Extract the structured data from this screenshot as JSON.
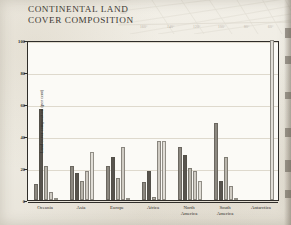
{
  "title": {
    "line1": "CONTINENTAL LAND",
    "line2": "COVER COMPOSITION"
  },
  "map": {
    "graticule_labels": [
      "180°",
      "160°",
      "140°",
      "120°",
      "100°",
      "80°",
      "60°"
    ],
    "line_color": "#d9d4c8"
  },
  "colors": {
    "paper": "#f0ede5",
    "plot_bg": "#fbfaf6",
    "axis": "#2f2d29",
    "grid": "#ded9cd",
    "series": [
      "#8c8880",
      "#58544e",
      "#b9b5ac",
      "#cfcbc3",
      "#e0ddd6"
    ]
  },
  "chart_data": {
    "type": "bar",
    "title": "CONTINENTAL LAND COVER COMPOSITION",
    "xlabel": "",
    "ylabel": "Land cover composition (per cent)",
    "ylim": [
      0,
      100
    ],
    "yticks": [
      0,
      20,
      40,
      60,
      80,
      100
    ],
    "ytick_labels": [
      "0",
      "20",
      "40",
      "60",
      "80",
      "100"
    ],
    "grid": true,
    "legend": "none",
    "categories": [
      "Oceania",
      "Asia",
      "Europe",
      "Africa",
      "North\nAmerica",
      "South\nAmerica",
      "Antarctica"
    ],
    "series": [
      {
        "name": "series-1",
        "values": [
          10,
          21,
          21,
          11,
          33,
          48,
          0
        ]
      },
      {
        "name": "series-2",
        "values": [
          57,
          17,
          27,
          18,
          28,
          12,
          0
        ]
      },
      {
        "name": "series-3",
        "values": [
          21,
          12,
          14,
          2,
          20,
          27,
          0
        ]
      },
      {
        "name": "series-4",
        "values": [
          5,
          18,
          33,
          37,
          18,
          9,
          0
        ]
      },
      {
        "name": "series-5",
        "values": [
          1,
          30,
          1,
          37,
          12,
          1,
          100
        ]
      }
    ]
  }
}
